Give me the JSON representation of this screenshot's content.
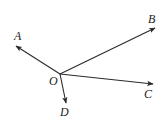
{
  "diagram": {
    "type": "geometry-rays",
    "origin": {
      "label": "O",
      "x": 60,
      "y": 74,
      "label_x": 49,
      "label_y": 85
    },
    "rays": [
      {
        "id": "A",
        "label": "A",
        "x": 16,
        "y": 46,
        "label_x": 14,
        "label_y": 40
      },
      {
        "id": "B",
        "label": "B",
        "x": 155,
        "y": 28,
        "label_x": 148,
        "label_y": 23
      },
      {
        "id": "C",
        "label": "C",
        "x": 153,
        "y": 84,
        "label_x": 144,
        "label_y": 98
      },
      {
        "id": "D",
        "label": "D",
        "x": 66,
        "y": 103,
        "label_x": 60,
        "label_y": 116
      }
    ],
    "colors": {
      "stroke": "#2a2a2a",
      "label": "#222222",
      "background": "#ffffff"
    }
  }
}
